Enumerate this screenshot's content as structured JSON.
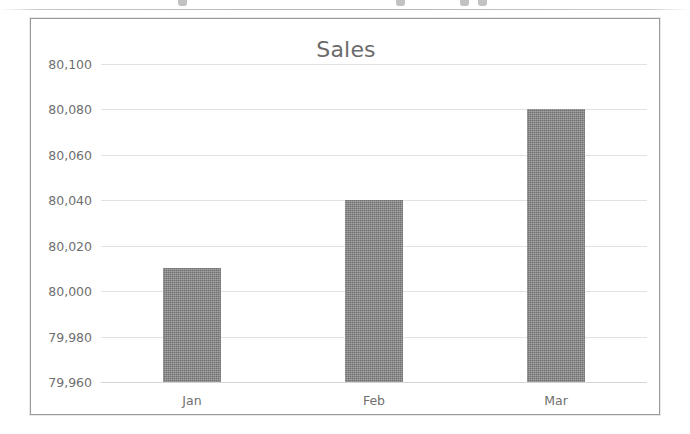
{
  "chart_data": {
    "type": "bar",
    "title": "Sales",
    "xlabel": "",
    "ylabel": "",
    "categories": [
      "Jan",
      "Feb",
      "Mar"
    ],
    "values": [
      80010,
      80040,
      80080
    ],
    "series": [
      {
        "name": "Sales",
        "values": [
          80010,
          80040,
          80080
        ]
      }
    ],
    "ylim": [
      79960,
      80100
    ],
    "ytick_step": 20,
    "ytick_labels": [
      "80,100",
      "80,080",
      "80,060",
      "80,040",
      "80,020",
      "80,000",
      "79,980",
      "79,960"
    ],
    "ytick_values": [
      80100,
      80080,
      80060,
      80040,
      80020,
      80000,
      79980,
      79960
    ],
    "xtick_labels": [
      "Jan",
      "Feb",
      "Mar"
    ],
    "grid": true,
    "legend": false,
    "legend_position": "none",
    "colors": {
      "bar": "#808080",
      "gridline": "#e2e2e2",
      "text": "#6f6f6f",
      "title_text": "#6b6b6b",
      "border": "#9a9a9a",
      "background": "#ffffff"
    }
  }
}
